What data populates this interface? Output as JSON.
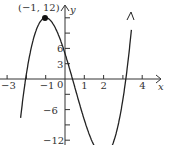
{
  "chart_data": {
    "type": "line",
    "title": "",
    "xlabel": "x",
    "ylabel": "y",
    "function": "f(x) = 2x^3 - 3x^2 - 12x + 5",
    "x_ticks": [
      -3,
      -2,
      -1,
      0,
      1,
      2,
      3,
      4
    ],
    "x_tick_labels": [
      "-3",
      "-1",
      "0",
      "1",
      "2",
      "4"
    ],
    "y_ticks": [
      -12,
      -9,
      -6,
      -3,
      3,
      6,
      9,
      12
    ],
    "y_tick_labels": [
      "6",
      "3",
      "-6",
      "-12"
    ],
    "annotations": [
      {
        "label": "(−1, 12)",
        "x": -1,
        "y": 12,
        "type": "point"
      }
    ],
    "xlim": [
      -3.4,
      4.5
    ],
    "ylim": [
      -13,
      15
    ],
    "grid": false
  },
  "labels": {
    "point": "(−1, 12)",
    "x_axis": "x",
    "y_axis": "y",
    "origin": "0"
  }
}
